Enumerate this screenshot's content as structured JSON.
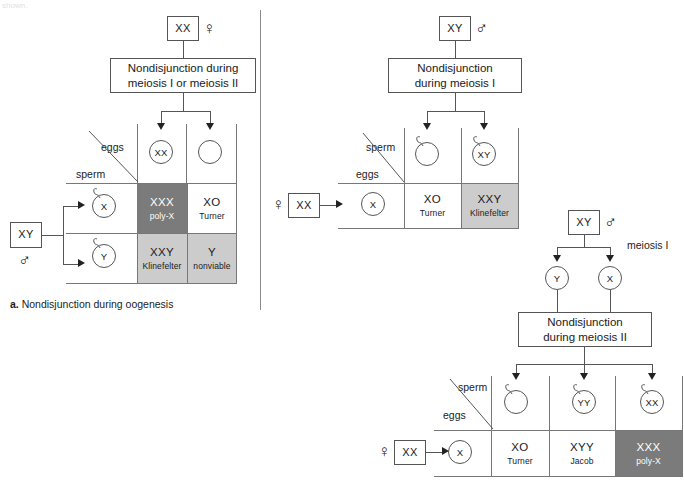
{
  "top_clipped_text": "shown.",
  "divider": {
    "x": 260,
    "y": 10,
    "height": 300
  },
  "panel_a": {
    "caption_marker": "a.",
    "caption_text": "Nondisjunction during oogenesis",
    "parent": {
      "genotype": "XX",
      "sex_symbol": "♀"
    },
    "process_box": {
      "line1": "Nondisjunction during",
      "line2": "meiosis I or meiosis II"
    },
    "gametes_top": [
      {
        "label": "XX",
        "type": "egg"
      },
      {
        "label": "",
        "type": "egg"
      }
    ],
    "axis_labels": {
      "columns": "eggs",
      "rows": "sperm"
    },
    "other_parent": {
      "genotype": "XY",
      "sex_symbol": "♂"
    },
    "gametes_side": [
      {
        "label": "X",
        "type": "sperm"
      },
      {
        "label": "Y",
        "type": "sperm"
      }
    ],
    "cells": [
      {
        "geno": "XXX",
        "pheno": "poly-X",
        "shade": "dark"
      },
      {
        "geno": "XO",
        "pheno": "Turner",
        "shade": "plain"
      },
      {
        "geno": "XXY",
        "pheno": "Klinefelter",
        "shade": "light"
      },
      {
        "geno": "Y",
        "pheno": "nonviable",
        "shade": "light"
      }
    ]
  },
  "panel_b": {
    "parent": {
      "genotype": "XY",
      "sex_symbol": "♂"
    },
    "process_box": {
      "line1": "Nondisjunction",
      "line2": "during meiosis I"
    },
    "gametes_top": [
      {
        "label": "",
        "type": "sperm"
      },
      {
        "label": "XY",
        "type": "sperm"
      }
    ],
    "axis_labels": {
      "columns": "sperm",
      "rows": "eggs"
    },
    "other_parent": {
      "genotype": "XX",
      "sex_symbol": "♀"
    },
    "gametes_side": [
      {
        "label": "X",
        "type": "egg"
      }
    ],
    "cells": [
      {
        "geno": "XO",
        "pheno": "Turner",
        "shade": "plain"
      },
      {
        "geno": "XXY",
        "pheno": "Klinefelter",
        "shade": "light"
      }
    ]
  },
  "panel_c": {
    "parent": {
      "genotype": "XY",
      "sex_symbol": "♂"
    },
    "stage_label": "meiosis I",
    "intermediates": [
      {
        "label": "Y"
      },
      {
        "label": "X"
      }
    ],
    "process_box": {
      "line1": "Nondisjunction",
      "line2": "during meiosis II"
    },
    "gametes_top": [
      {
        "label": "",
        "type": "sperm"
      },
      {
        "label": "YY",
        "type": "sperm"
      },
      {
        "label": "XX",
        "type": "sperm"
      }
    ],
    "axis_labels": {
      "columns": "sperm",
      "rows": "eggs"
    },
    "other_parent": {
      "genotype": "XX",
      "sex_symbol": "♀"
    },
    "gametes_side": [
      {
        "label": "X",
        "type": "egg"
      }
    ],
    "cells": [
      {
        "geno": "XO",
        "pheno": "Turner",
        "shade": "plain"
      },
      {
        "geno": "XYY",
        "pheno": "Jacob",
        "shade": "plain"
      },
      {
        "geno": "XXX",
        "pheno": "poly-X",
        "shade": "dark"
      }
    ]
  },
  "colors": {
    "dark_shade": "#7b7b7b",
    "light_shade": "#cccccc",
    "line": "#555555",
    "grid_line": "#777777",
    "text": "#1a1a1a"
  }
}
